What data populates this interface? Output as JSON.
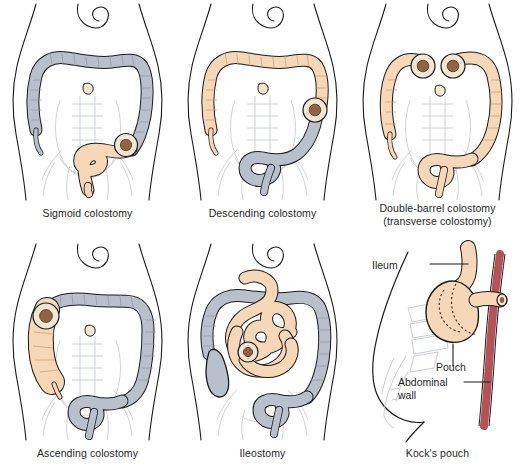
{
  "figure": {
    "background_color": "#ffffff",
    "colors": {
      "colon_grey": "#b9c0cc",
      "colon_peach": "#f6d7b8",
      "stoma_ring": "#f3e6d2",
      "stoma_center": "#8f6343",
      "outline": "#1a1a1a",
      "faint_anatomy": "#c9cdd6",
      "abdominal_wall_red": "#b4525a",
      "text": "#1f1f1f"
    }
  },
  "panels": [
    {
      "id": "sigmoid-colostomy",
      "caption": "Sigmoid colostomy",
      "caption_line2": "",
      "highlight": "sigmoid colon",
      "highlight_color": "#f6d7b8",
      "colon_color": "#b9c0cc",
      "stoma_count": 1,
      "stoma_side": "left"
    },
    {
      "id": "descending-colostomy",
      "caption": "Descending colostomy",
      "caption_line2": "",
      "highlight": "ascending and transverse colon",
      "highlight_color": "#f6d7b8",
      "colon_color": "#b9c0cc",
      "stoma_count": 1,
      "stoma_side": "left"
    },
    {
      "id": "double-barrel-colostomy",
      "caption": "Double-barrel colostomy",
      "caption_line2": "(transverse colostomy)",
      "highlight": "entire colon",
      "highlight_color": "#f6d7b8",
      "colon_color": "#f6d7b8",
      "stoma_count": 2,
      "stoma_side": "center"
    },
    {
      "id": "ascending-colostomy",
      "caption": "Ascending colostomy",
      "caption_line2": "",
      "highlight": "ascending colon",
      "highlight_color": "#f6d7b8",
      "colon_color": "#b9c0cc",
      "stoma_count": 1,
      "stoma_side": "right"
    },
    {
      "id": "ileostomy",
      "caption": "Ileostomy",
      "caption_line2": "",
      "highlight": "small intestine",
      "highlight_color": "#f6d7b8",
      "colon_color": "#b9c0cc",
      "stoma_count": 1,
      "stoma_side": "center"
    },
    {
      "id": "kocks-pouch",
      "caption": "Kock's pouch",
      "caption_line2": "",
      "highlight": "ileal pouch",
      "highlight_color": "#f6d7b8",
      "colon_color": "#f6d7b8",
      "stoma_count": 1,
      "stoma_side": "right"
    }
  ],
  "kocks_pouch_labels": [
    {
      "id": "ileum",
      "text": "Ileum"
    },
    {
      "id": "pouch",
      "text": "Pouch"
    },
    {
      "id": "abdominal-wall-line1",
      "text": "Abdominal"
    },
    {
      "id": "abdominal-wall-line2",
      "text": "wall"
    }
  ]
}
